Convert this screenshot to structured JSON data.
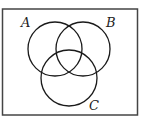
{
  "diagram": {
    "type": "venn",
    "universe": {
      "x": 2.5,
      "y": 9,
      "width": 135,
      "height": 106
    },
    "sets": [
      {
        "label": "A",
        "cx": 55,
        "cy": 49,
        "r": 27,
        "label_x": 21,
        "label_y": 27
      },
      {
        "label": "B",
        "cx": 83,
        "cy": 49,
        "r": 27,
        "label_x": 106,
        "label_y": 27
      },
      {
        "label": "C",
        "cx": 69,
        "cy": 78,
        "r": 28,
        "label_x": 89,
        "label_y": 110
      }
    ],
    "colors": {
      "stroke": "#1a1a1a",
      "frame": "#444444",
      "background": "#ffffff"
    }
  }
}
